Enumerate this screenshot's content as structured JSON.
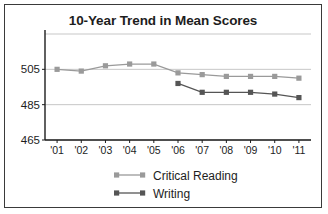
{
  "chart_data": {
    "type": "line",
    "title": "10-Year Trend in Mean Scores",
    "xlabel": "",
    "ylabel": "",
    "categories": [
      "'01",
      "'02",
      "'03",
      "'04",
      "'05",
      "'06",
      "'07",
      "'08",
      "'09",
      "'10",
      "'11"
    ],
    "yticks": [
      465,
      485,
      505
    ],
    "ylim": [
      465,
      525
    ],
    "grid": true,
    "legend_position": "bottom",
    "series": [
      {
        "name": "Critical Reading",
        "color": "#9a9a9a",
        "marker": "square",
        "values": [
          505,
          504,
          507,
          508,
          508,
          503,
          502,
          501,
          501,
          501,
          500
        ]
      },
      {
        "name": "Writing",
        "color": "#555555",
        "marker": "square",
        "values": [
          null,
          null,
          null,
          null,
          null,
          497,
          492,
          492,
          492,
          491,
          489
        ]
      }
    ]
  },
  "legend": {
    "items": [
      {
        "label": "Critical Reading"
      },
      {
        "label": "Writing"
      }
    ]
  },
  "axis": {
    "y_labels": [
      "505",
      "485",
      "465"
    ],
    "x_labels": [
      "'01",
      "'02",
      "'03",
      "'04",
      "'05",
      "'06",
      "'07",
      "'08",
      "'09",
      "'10",
      "'11"
    ]
  }
}
